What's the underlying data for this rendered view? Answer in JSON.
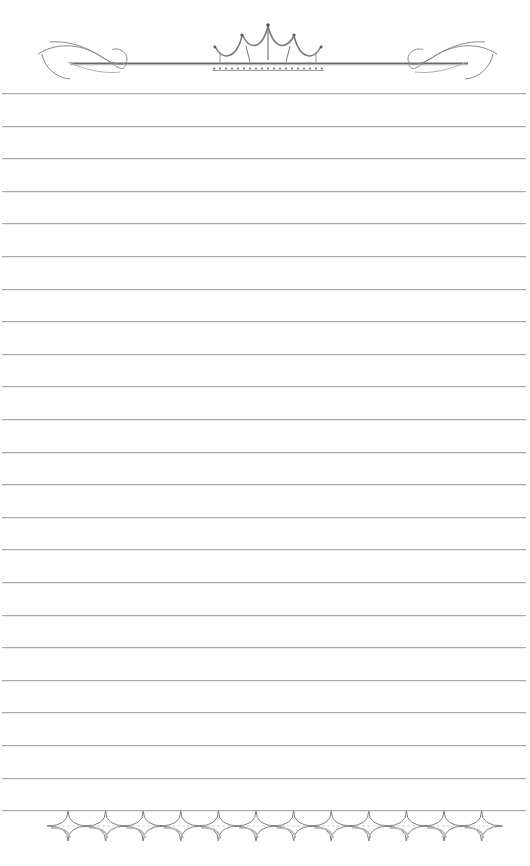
{
  "page": {
    "type": "lined-stationery",
    "background": "#ffffff",
    "line_color": "#a8a8a8",
    "ornament_color": "#7a7a7a"
  },
  "header": {
    "ornament": "crown-with-flourishes-icon",
    "bead_count": 17
  },
  "lines": {
    "count": 23,
    "first_y": 93,
    "spacing": 32.6
  },
  "footer": {
    "ornament": "four-point-star-border-icon",
    "star_count": 12
  }
}
